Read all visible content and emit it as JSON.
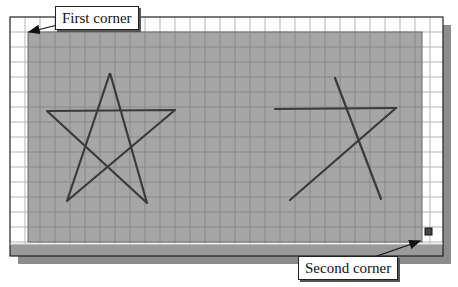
{
  "figure": {
    "frame": {
      "x": 10,
      "y": 17,
      "w": 433,
      "h": 227,
      "band_h": 12,
      "shadow_offset": 8
    },
    "grid": {
      "spacing": 15,
      "line_color": "#b5b5b5",
      "frame_color": "#222222"
    },
    "selection": {
      "x": 28,
      "y": 32,
      "w": 394,
      "h": 210,
      "fill": "#a6a6a6",
      "grid_line": "#888888"
    },
    "cursor_box": {
      "x": 425,
      "y": 228,
      "size": 7,
      "color": "#444444"
    },
    "colors": {
      "band": "#9a9a9a",
      "shadow": "#8c8c8c",
      "stroke": "#3a3a3a"
    }
  },
  "shapes": {
    "star_full": {
      "points": [
        [
          110,
          73
        ],
        [
          147,
          203
        ],
        [
          47,
          111
        ],
        [
          175,
          110
        ],
        [
          67,
          201
        ],
        [
          110,
          73
        ]
      ]
    },
    "star_partial": {
      "segments": [
        [
          [
            335,
            78
          ],
          [
            381,
            199
          ]
        ],
        [
          [
            275,
            109
          ],
          [
            396,
            108
          ]
        ],
        [
          [
            396,
            108
          ],
          [
            290,
            200
          ]
        ]
      ]
    }
  },
  "callouts": {
    "first": {
      "label": "First corner",
      "x": 55,
      "y": 6,
      "arrow_from": [
        70,
        22
      ],
      "arrow_to": [
        29,
        32
      ]
    },
    "second": {
      "label": "Second corner",
      "x": 298,
      "y": 256,
      "arrow_from": [
        360,
        262
      ],
      "arrow_to": [
        420,
        241
      ]
    }
  }
}
